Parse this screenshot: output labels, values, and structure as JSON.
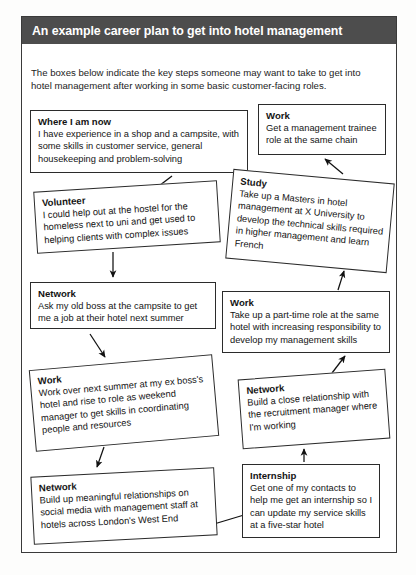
{
  "document": {
    "title": "An example career plan to get into hotel management",
    "intro": "The boxes below indicate the key steps someone may want to take to get into hotel management after working in some basic customer-facing roles.",
    "header_bg": "#4d4d4d",
    "header_text_color": "#ffffff",
    "page_bg": "#ffffff",
    "box_border": "#2b2b2b"
  },
  "nodes": {
    "now": {
      "heading": "Where I am now",
      "body": "I have experience in a shop and a campsite, with some skills in customer service, general housekeeping and problem-solving"
    },
    "work1": {
      "heading": "Work",
      "body": "Get a management trainee role at the same chain"
    },
    "volunteer": {
      "heading": "Volunteer",
      "body": "I could help out at the hostel for the homeless next to uni and get used to helping clients with complex issues"
    },
    "study": {
      "heading": "Study",
      "body": "Take up a Masters in hotel management at X University to develop the technical skills required in higher management and learn French"
    },
    "network1": {
      "heading": "Network",
      "body": "Ask my old boss at the campsite to get me a job at their hotel next summer"
    },
    "work2": {
      "heading": "Work",
      "body": "Take up a part-time role at the same hotel with increasing responsibility to develop my management skills"
    },
    "work3": {
      "heading": "Work",
      "body": "Work over next summer at my ex boss's hotel and rise to role as weekend manager to get skills in coordinating people and resources"
    },
    "network2": {
      "heading": "Network",
      "body": "Build a close relationship with the recruitment manager where I'm working"
    },
    "network3": {
      "heading": "Network",
      "body": "Build up meaningful relationships on social media with management staff at hotels across London's West End"
    },
    "internship": {
      "heading": "Internship",
      "body": "Get one of my contacts to help me get an internship so I can update my service skills at a five-star hotel"
    }
  },
  "flow": {
    "type": "flowchart",
    "edges": [
      {
        "from": "now",
        "to": "volunteer",
        "label": ""
      },
      {
        "from": "volunteer",
        "to": "network1",
        "label": ""
      },
      {
        "from": "network1",
        "to": "work3",
        "label": ""
      },
      {
        "from": "work3",
        "to": "network3",
        "label": ""
      },
      {
        "from": "network3",
        "to": "internship",
        "label": ""
      },
      {
        "from": "internship",
        "to": "network2",
        "label": ""
      },
      {
        "from": "network2",
        "to": "work2",
        "label": ""
      },
      {
        "from": "work2",
        "to": "study",
        "label": ""
      },
      {
        "from": "study",
        "to": "work1",
        "label": ""
      }
    ]
  }
}
